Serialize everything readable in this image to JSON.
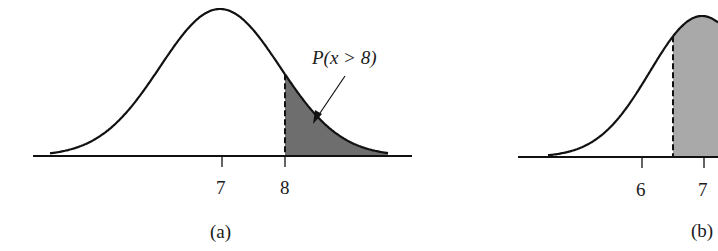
{
  "panels": [
    {
      "id": "a",
      "caption": "(a)",
      "annotation": "P(x > 8)",
      "shaded_region": "x > 8",
      "shade_color": "#6e6e6e",
      "ticks": [
        {
          "value": "7",
          "px": 222
        },
        {
          "value": "8",
          "px": 285
        }
      ],
      "cutoff_value": 8
    },
    {
      "id": "b",
      "caption": "(b)",
      "annotation": "",
      "shaded_region": "x > cutoff (between 6 and 7)",
      "shade_color": "#a9a9a9",
      "ticks": [
        {
          "value": "6",
          "px": 642
        },
        {
          "value": "7",
          "px": 704
        }
      ]
    }
  ],
  "colors": {
    "line": "#111111",
    "background": "#ffffff"
  }
}
